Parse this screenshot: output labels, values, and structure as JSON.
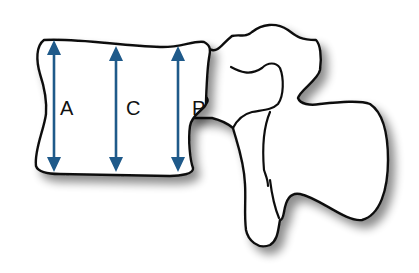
{
  "diagram": {
    "labels": {
      "anterior": "A",
      "central": "C",
      "posterior": "P"
    },
    "colors": {
      "arrow": "#1f5a8a",
      "outline": "#111111",
      "fill": "#ffffff",
      "shadow": "#9a9a9a"
    }
  }
}
